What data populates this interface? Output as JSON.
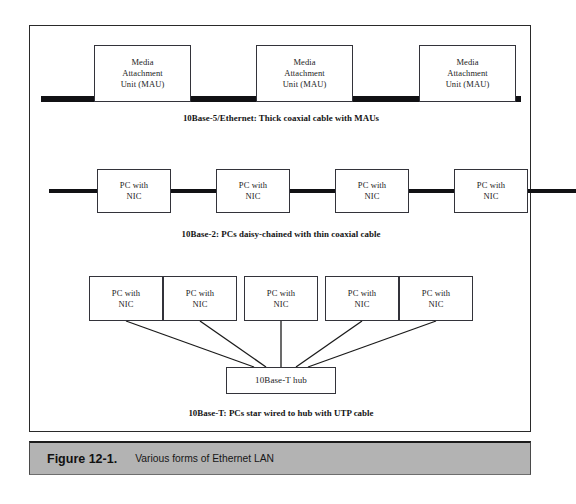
{
  "figure": {
    "number": "Figure 12-1.",
    "title": "Various forms of Ethernet LAN"
  },
  "rows": [
    {
      "id": "10base5",
      "caption": "10Base-5/Ethernet: Thick coaxial cable with MAUs",
      "medium": "thick coaxial cable",
      "nodes": [
        {
          "label": "Media\nAttachment\nUnit (MAU)"
        },
        {
          "label": "Media\nAttachment\nUnit (MAU)"
        },
        {
          "label": "Media\nAttachment\nUnit (MAU)"
        }
      ]
    },
    {
      "id": "10base2",
      "caption": "10Base-2: PCs daisy-chained with thin coaxial cable",
      "medium": "thin coaxial cable",
      "nodes": [
        {
          "label": "PC with\nNIC"
        },
        {
          "label": "PC with\nNIC"
        },
        {
          "label": "PC with\nNIC"
        },
        {
          "label": "PC with\nNIC"
        }
      ]
    },
    {
      "id": "10baseT",
      "caption": "10Base-T: PCs star wired to hub with UTP cable",
      "medium": "UTP cable",
      "hub": {
        "label": "10Base-T hub"
      },
      "nodes": [
        {
          "label": "PC with\nNIC"
        },
        {
          "label": "PC with\nNIC"
        },
        {
          "label": "PC with\nNIC"
        },
        {
          "label": "PC with\nNIC"
        },
        {
          "label": "PC with\nNIC"
        }
      ]
    }
  ],
  "colors": {
    "cable": "#111114",
    "box_border": "#33333a",
    "frame": "#2a2a2a",
    "caption_bar": "#b3b3b3",
    "text": "#1c1c1c"
  }
}
